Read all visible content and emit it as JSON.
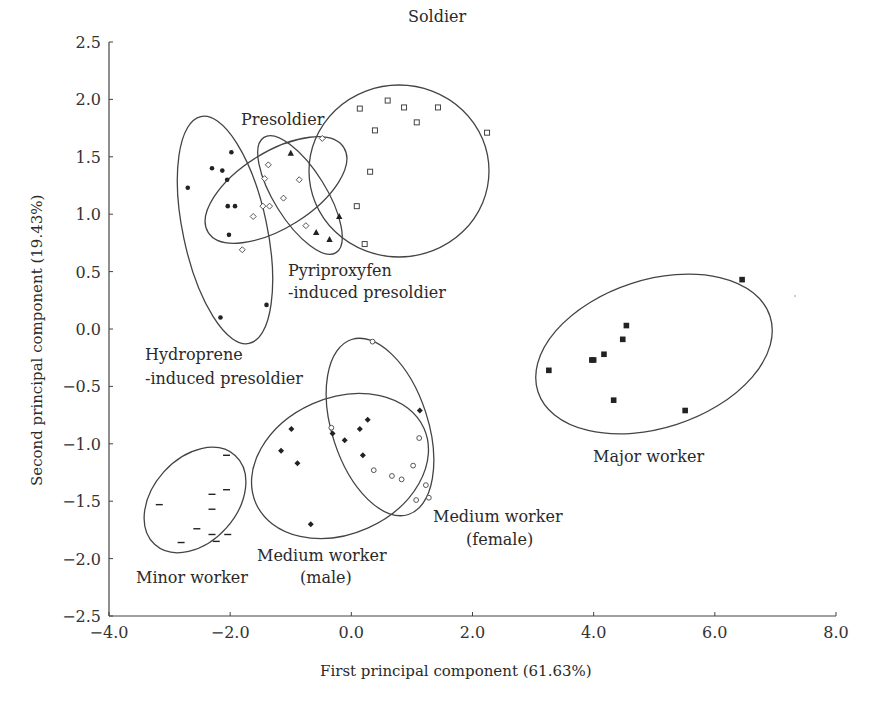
{
  "chart_data": {
    "type": "scatter",
    "title": "",
    "xlabel": "First principal component (61.63%)",
    "ylabel": "Second principal component (19.43%)",
    "xlim": [
      -4.0,
      8.0
    ],
    "ylim": [
      -2.5,
      2.5
    ],
    "xticks": [
      "−4.0",
      "−2.0",
      "0.0",
      "2.0",
      "4.0",
      "6.0",
      "8.0"
    ],
    "yticks": [
      "2.5",
      "2.0",
      "1.5",
      "1.0",
      "0.5",
      "0.0",
      "−0.5",
      "−1.0",
      "−1.5",
      "−2.0",
      "−2.5"
    ],
    "grid": false,
    "legend": "none (groups labeled directly with text next to ellipses)",
    "series": [
      {
        "name": "Soldier",
        "marker": "open-square",
        "x": [
          0.14,
          0.6,
          0.87,
          1.43,
          1.08,
          0.39,
          2.24,
          0.31,
          0.09,
          0.22
        ],
        "y": [
          1.92,
          1.99,
          1.93,
          1.93,
          1.8,
          1.73,
          1.71,
          1.37,
          1.07,
          0.74
        ]
      },
      {
        "name": "Presoldier",
        "marker": "open-diamond",
        "x": [
          -0.48,
          -1.37,
          -1.43,
          -0.86,
          -1.12,
          -1.35,
          -1.46,
          -1.62,
          -1.8,
          -0.75
        ],
        "y": [
          1.66,
          1.43,
          1.31,
          1.3,
          1.14,
          1.07,
          1.07,
          0.98,
          0.69,
          0.9
        ]
      },
      {
        "name": "Pyriproxyfen-induced presoldier",
        "marker": "filled-triangle",
        "x": [
          -1.0,
          -0.2,
          -0.36,
          -0.58
        ],
        "y": [
          1.53,
          0.98,
          0.78,
          0.84
        ]
      },
      {
        "name": "Hydroprene-induced presoldier",
        "marker": "filled-circle",
        "x": [
          -2.7,
          -2.3,
          -1.98,
          -2.13,
          -2.05,
          -1.92,
          -2.04,
          -2.02,
          -1.4,
          -2.16
        ],
        "y": [
          1.23,
          1.4,
          1.54,
          1.38,
          1.3,
          1.07,
          1.07,
          0.82,
          0.21,
          0.1
        ]
      },
      {
        "name": "Major worker",
        "marker": "filled-square",
        "x": [
          6.45,
          4.54,
          4.48,
          4.17,
          3.97,
          4.0,
          3.26,
          4.33,
          5.51
        ],
        "y": [
          0.43,
          0.03,
          -0.09,
          -0.22,
          -0.27,
          -0.27,
          -0.36,
          -0.62,
          -0.71
        ]
      },
      {
        "name": "Minor worker",
        "marker": "dash",
        "x": [
          -3.17,
          -2.06,
          -2.06,
          -2.3,
          -2.3,
          -2.55,
          -2.3,
          -2.04,
          -2.81,
          -2.23
        ],
        "y": [
          -1.53,
          -1.1,
          -1.4,
          -1.44,
          -1.57,
          -1.74,
          -1.79,
          -1.79,
          -1.86,
          -1.85
        ]
      },
      {
        "name": "Medium worker (male)",
        "marker": "filled-diamond",
        "x": [
          -0.99,
          -1.16,
          -0.89,
          -0.31,
          -0.11,
          0.14,
          0.27,
          0.19,
          1.13,
          -0.67
        ],
        "y": [
          -0.87,
          -1.06,
          -1.17,
          -0.91,
          -0.97,
          -0.87,
          -0.79,
          -1.1,
          -0.71,
          -1.7
        ]
      },
      {
        "name": "Medium worker (female)",
        "marker": "open-circle",
        "x": [
          0.35,
          -0.33,
          1.12,
          1.02,
          0.37,
          0.67,
          0.83,
          1.23,
          1.07,
          1.28
        ],
        "y": [
          -0.11,
          -0.86,
          -0.95,
          -1.19,
          -1.23,
          -1.28,
          -1.31,
          -1.36,
          -1.49,
          -1.47
        ]
      }
    ],
    "annotations": [
      "Soldier",
      "Presoldier",
      "Pyriproxyfen",
      "-induced presoldier",
      "Hydroprene",
      "-induced presoldier",
      "Major worker",
      "Medium worker",
      "(female)",
      "Medium worker",
      "(male)",
      "Minor worker"
    ],
    "ellipses": "95% confidence ellipses drawn around each group"
  },
  "labels": {
    "soldier": "Soldier",
    "presoldier": "Presoldier",
    "pyri_1": "Pyriproxyfen",
    "pyri_2": "-induced presoldier",
    "hydro_1": "Hydroprene",
    "hydro_2": "-induced presoldier",
    "major": "Major worker",
    "medf_1": "Medium worker",
    "medf_2": "(female)",
    "medm_1": "Medium worker",
    "medm_2": "(male)",
    "minor": "Minor worker"
  },
  "axes": {
    "xlabel": "First principal component (61.63%)",
    "ylabel": "Second principal component (19.43%)"
  }
}
